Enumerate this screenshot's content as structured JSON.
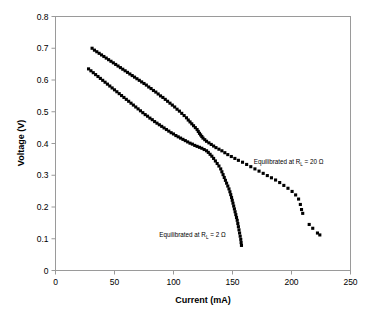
{
  "chart_data": {
    "type": "scatter",
    "title": "",
    "xlabel": "Current (mA)",
    "ylabel": "Voltage (V)",
    "xlim": [
      0,
      250
    ],
    "ylim": [
      0,
      0.8
    ],
    "xticks": [
      "0",
      "50",
      "100",
      "150",
      "200",
      "250"
    ],
    "yticks": [
      "0",
      "0.1",
      "0.2",
      "0.3",
      "0.4",
      "0.5",
      "0.6",
      "0.7",
      "0.8"
    ],
    "grid": false,
    "legend_position": "inline-annotation",
    "marker": "square",
    "marker_color": "#000000",
    "annotations": [
      {
        "name": "label-20-ohm",
        "prefix": "Equilibrated at R",
        "subscript": "L",
        "suffix": " = 20 Ω",
        "text": "Equilibrated at RL = 20 Ω",
        "x": 168,
        "y": 0.335
      },
      {
        "name": "label-2-ohm",
        "prefix": "Equilibrated at R",
        "subscript": "L",
        "suffix": " = 2 Ω",
        "text": "Equilibrated at RL = 2 Ω",
        "x": 88,
        "y": 0.105
      }
    ],
    "series": [
      {
        "name": "Equilibrated at RL = 20 Ω",
        "points": [
          [
            31.0,
            0.7
          ],
          [
            33.0,
            0.694
          ],
          [
            35.0,
            0.689
          ],
          [
            37.0,
            0.684
          ],
          [
            39.0,
            0.679
          ],
          [
            41.0,
            0.674
          ],
          [
            43.0,
            0.669
          ],
          [
            45.0,
            0.664
          ],
          [
            47.0,
            0.659
          ],
          [
            49.0,
            0.654
          ],
          [
            51.0,
            0.649
          ],
          [
            53.0,
            0.644
          ],
          [
            55.0,
            0.639
          ],
          [
            57.0,
            0.634
          ],
          [
            59.0,
            0.629
          ],
          [
            61.0,
            0.624
          ],
          [
            63.0,
            0.619
          ],
          [
            65.0,
            0.614
          ],
          [
            67.0,
            0.609
          ],
          [
            69.0,
            0.604
          ],
          [
            71.0,
            0.599
          ],
          [
            73.0,
            0.594
          ],
          [
            75.0,
            0.589
          ],
          [
            77.0,
            0.584
          ],
          [
            79.0,
            0.578
          ],
          [
            81.0,
            0.573
          ],
          [
            83.0,
            0.567
          ],
          [
            85.0,
            0.562
          ],
          [
            87.0,
            0.556
          ],
          [
            89.0,
            0.55
          ],
          [
            91.0,
            0.545
          ],
          [
            93.0,
            0.539
          ],
          [
            95.0,
            0.533
          ],
          [
            97.0,
            0.527
          ],
          [
            99.0,
            0.521
          ],
          [
            101.0,
            0.515
          ],
          [
            103.0,
            0.508
          ],
          [
            105.0,
            0.502
          ],
          [
            107.0,
            0.495
          ],
          [
            109.0,
            0.488
          ],
          [
            111.0,
            0.481
          ],
          [
            112.5,
            0.474
          ],
          [
            114.0,
            0.468
          ],
          [
            115.5,
            0.462
          ],
          [
            117.0,
            0.456
          ],
          [
            118.5,
            0.45
          ],
          [
            120.0,
            0.444
          ],
          [
            121.0,
            0.438
          ],
          [
            122.0,
            0.432
          ],
          [
            123.0,
            0.427
          ],
          [
            124.0,
            0.422
          ],
          [
            125.0,
            0.417
          ],
          [
            126.5,
            0.412
          ],
          [
            128.0,
            0.407
          ],
          [
            130.0,
            0.402
          ],
          [
            132.0,
            0.397
          ],
          [
            134.0,
            0.392
          ],
          [
            136.0,
            0.387
          ],
          [
            138.5,
            0.382
          ],
          [
            141.0,
            0.377
          ],
          [
            143.5,
            0.371
          ],
          [
            146.0,
            0.365
          ],
          [
            149.0,
            0.359
          ],
          [
            152.0,
            0.353
          ],
          [
            155.0,
            0.347
          ],
          [
            158.5,
            0.341
          ],
          [
            162.0,
            0.334
          ],
          [
            165.5,
            0.327
          ],
          [
            169.0,
            0.32
          ],
          [
            172.5,
            0.313
          ],
          [
            176.0,
            0.306
          ],
          [
            179.5,
            0.299
          ],
          [
            183.0,
            0.292
          ],
          [
            186.5,
            0.285
          ],
          [
            190.0,
            0.277
          ],
          [
            193.5,
            0.268
          ],
          [
            197.0,
            0.259
          ],
          [
            200.5,
            0.249
          ],
          [
            203.5,
            0.238
          ],
          [
            206.0,
            0.225
          ],
          [
            207.5,
            0.208
          ],
          [
            208.5,
            0.192
          ],
          [
            209.5,
            0.18
          ],
          [
            215.0,
            0.145
          ],
          [
            218.0,
            0.133
          ],
          [
            222.0,
            0.118
          ],
          [
            224.0,
            0.112
          ]
        ]
      },
      {
        "name": "Equilibrated at RL = 2 Ω",
        "points": [
          [
            28.0,
            0.635
          ],
          [
            30.0,
            0.629
          ],
          [
            32.0,
            0.623
          ],
          [
            34.0,
            0.617
          ],
          [
            36.0,
            0.611
          ],
          [
            38.0,
            0.605
          ],
          [
            40.0,
            0.599
          ],
          [
            42.0,
            0.593
          ],
          [
            44.0,
            0.587
          ],
          [
            46.0,
            0.581
          ],
          [
            48.0,
            0.575
          ],
          [
            50.0,
            0.569
          ],
          [
            52.0,
            0.563
          ],
          [
            54.0,
            0.557
          ],
          [
            56.0,
            0.551
          ],
          [
            58.0,
            0.545
          ],
          [
            60.0,
            0.539
          ],
          [
            62.0,
            0.533
          ],
          [
            64.0,
            0.527
          ],
          [
            66.0,
            0.521
          ],
          [
            68.0,
            0.515
          ],
          [
            70.0,
            0.509
          ],
          [
            72.0,
            0.503
          ],
          [
            74.0,
            0.497
          ],
          [
            76.0,
            0.491
          ],
          [
            78.0,
            0.486
          ],
          [
            80.0,
            0.48
          ],
          [
            82.0,
            0.475
          ],
          [
            84.0,
            0.469
          ],
          [
            86.0,
            0.464
          ],
          [
            88.0,
            0.459
          ],
          [
            90.0,
            0.454
          ],
          [
            92.0,
            0.449
          ],
          [
            94.0,
            0.444
          ],
          [
            96.0,
            0.439
          ],
          [
            98.0,
            0.434
          ],
          [
            100.0,
            0.43
          ],
          [
            102.0,
            0.425
          ],
          [
            104.0,
            0.421
          ],
          [
            106.0,
            0.417
          ],
          [
            108.0,
            0.413
          ],
          [
            110.0,
            0.409
          ],
          [
            112.0,
            0.405
          ],
          [
            114.0,
            0.401
          ],
          [
            116.0,
            0.398
          ],
          [
            118.0,
            0.394
          ],
          [
            120.0,
            0.391
          ],
          [
            122.0,
            0.388
          ],
          [
            124.0,
            0.385
          ],
          [
            126.0,
            0.381
          ],
          [
            128.0,
            0.377
          ],
          [
            129.5,
            0.372
          ],
          [
            131.0,
            0.366
          ],
          [
            132.5,
            0.36
          ],
          [
            134.0,
            0.353
          ],
          [
            135.5,
            0.345
          ],
          [
            137.0,
            0.337
          ],
          [
            138.5,
            0.329
          ],
          [
            140.0,
            0.32
          ],
          [
            141.0,
            0.311
          ],
          [
            142.0,
            0.302
          ],
          [
            143.0,
            0.293
          ],
          [
            144.0,
            0.284
          ],
          [
            145.0,
            0.275
          ],
          [
            146.0,
            0.266
          ],
          [
            147.0,
            0.257
          ],
          [
            147.8,
            0.248
          ],
          [
            148.5,
            0.239
          ],
          [
            149.2,
            0.23
          ],
          [
            149.8,
            0.221
          ],
          [
            150.4,
            0.212
          ],
          [
            151.0,
            0.203
          ],
          [
            151.6,
            0.194
          ],
          [
            152.2,
            0.185
          ],
          [
            152.8,
            0.176
          ],
          [
            153.4,
            0.167
          ],
          [
            154.0,
            0.158
          ],
          [
            154.5,
            0.148
          ],
          [
            155.0,
            0.138
          ],
          [
            155.5,
            0.128
          ],
          [
            156.0,
            0.118
          ],
          [
            156.5,
            0.108
          ],
          [
            157.0,
            0.098
          ],
          [
            157.3,
            0.088
          ],
          [
            157.6,
            0.079
          ]
        ]
      }
    ]
  }
}
